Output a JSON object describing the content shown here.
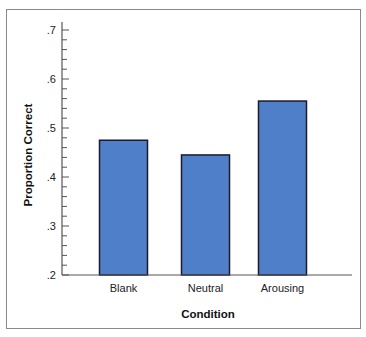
{
  "chart_data": {
    "type": "bar",
    "title": "",
    "xlabel": "Condition",
    "ylabel": "Proportion Correct",
    "categories": [
      "Blank",
      "Neutral",
      "Arousing"
    ],
    "values": [
      0.475,
      0.445,
      0.555
    ],
    "ylim": [
      0.2,
      0.7
    ],
    "yticks": [
      0.2,
      0.3,
      0.4,
      0.5,
      0.6,
      0.7
    ],
    "ytick_labels": [
      ".2",
      ".3",
      ".4",
      ".5",
      ".6",
      ".7"
    ],
    "minor_ticks_per_major": 4,
    "grid": false,
    "legend": "none",
    "bar_color": "#4f7fc8",
    "bar_edge_color": "#1a1a2a"
  }
}
